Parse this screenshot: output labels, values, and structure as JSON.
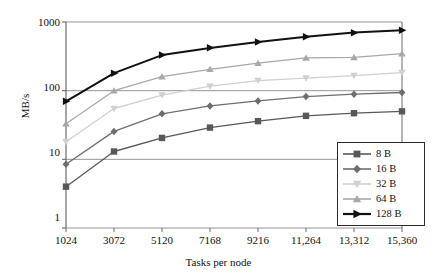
{
  "chart_data": {
    "type": "line",
    "title": "",
    "xlabel": "Tasks per node",
    "ylabel": "MB/s",
    "yscale": "log",
    "ylim": [
      1,
      1000
    ],
    "ytick_labels": [
      "1000",
      "100",
      "10",
      "1"
    ],
    "ytick_values": [
      1000,
      100,
      10,
      1
    ],
    "grid": "horizontal",
    "legend_position": "bottom-right",
    "categories": [
      "1024",
      "3072",
      "5120",
      "7168",
      "9216",
      "11,264",
      "13,312",
      "15,360"
    ],
    "x": [
      1024,
      3072,
      5120,
      7168,
      9216,
      11264,
      13312,
      15360
    ],
    "xtick_labels": [
      "1024",
      "3072",
      "5120",
      "7168",
      "9216",
      "11,264",
      "13,312",
      "15,360"
    ],
    "series": [
      {
        "name": "8 B",
        "marker": "square",
        "color": "#585858",
        "values": [
          4.0,
          13.0,
          20.5,
          29.0,
          36.0,
          43.0,
          47.0,
          50.0
        ]
      },
      {
        "name": "16 B",
        "marker": "diamond",
        "color": "#6e6e6e",
        "values": [
          8.5,
          25.5,
          46.0,
          60.0,
          71.0,
          82.0,
          89.0,
          94.0
        ]
      },
      {
        "name": "32 B",
        "marker": "triangle-down",
        "color": "#d0d0d0",
        "values": [
          18.0,
          55.0,
          86.0,
          116.0,
          140.0,
          152.0,
          166.0,
          183.0
        ]
      },
      {
        "name": "64 B",
        "marker": "triangle-up",
        "color": "#a8a8a8",
        "values": [
          33.0,
          100.0,
          160.0,
          205.0,
          252.0,
          300.0,
          305.0,
          345.0
        ]
      },
      {
        "name": "128 B",
        "marker": "triangle-right",
        "color": "#111111",
        "values": [
          70.0,
          180.0,
          330.0,
          420.0,
          510.0,
          610.0,
          700.0,
          760.0
        ]
      }
    ]
  },
  "axes": {
    "ylabel": "MB/s",
    "xlabel": "Tasks per node",
    "ytick_0": "1000",
    "ytick_1": "100",
    "ytick_2": "10",
    "ytick_3": "1",
    "xtick_0": "1024",
    "xtick_1": "3072",
    "xtick_2": "5120",
    "xtick_3": "7168",
    "xtick_4": "9216",
    "xtick_5": "11,264",
    "xtick_6": "13,312",
    "xtick_7": "15,360"
  },
  "legend": {
    "items": [
      {
        "label": "8 B"
      },
      {
        "label": "16 B"
      },
      {
        "label": "32 B"
      },
      {
        "label": "64 B"
      },
      {
        "label": "128 B"
      }
    ]
  },
  "colors": {
    "axis": "#6b6b6b",
    "grid": "#8a8a8a",
    "text": "#111111",
    "background": "#ffffff"
  }
}
